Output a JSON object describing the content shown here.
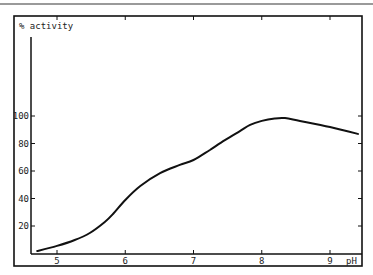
{
  "chart_data": {
    "type": "line",
    "title": "",
    "ylabel": "% activity",
    "xlabel": "pH",
    "xlim": [
      4.6,
      9.45
    ],
    "ylim": [
      0,
      110
    ],
    "x_ticks": [
      5,
      6,
      7,
      8,
      9
    ],
    "y_ticks": [
      20,
      40,
      60,
      80,
      100
    ],
    "grid": false,
    "legend": null,
    "series": [
      {
        "name": "% activity",
        "x": [
          4.71,
          5.0,
          5.26,
          5.48,
          5.7,
          5.82,
          6.0,
          6.22,
          6.51,
          6.8,
          7.0,
          7.24,
          7.46,
          7.68,
          7.83,
          8.0,
          8.19,
          8.34,
          8.56,
          9.0,
          9.41
        ],
        "y": [
          1.8,
          5.5,
          9.8,
          14.9,
          22.9,
          28.7,
          38.9,
          49.1,
          58.5,
          64.4,
          68,
          75.3,
          82.5,
          89,
          93.5,
          96.4,
          98.2,
          98.5,
          96.4,
          92,
          87
        ]
      }
    ]
  },
  "labels": {
    "y_axis_title": "% activity",
    "x_axis_title": "pH",
    "x_tick_labels": [
      "5",
      "6",
      "7",
      "8",
      "9"
    ],
    "y_tick_labels": [
      "20",
      "40",
      "60",
      "80",
      "100"
    ]
  }
}
